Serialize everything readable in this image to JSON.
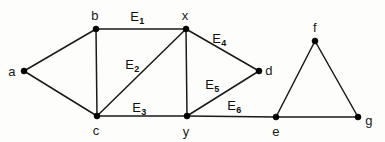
{
  "diagram": {
    "background_color": "#fdfdfb",
    "stroke_color": "#1a1a1a",
    "width": 385,
    "height": 142,
    "vertices": [
      {
        "id": "a",
        "label": "a",
        "x": 24,
        "y": 71,
        "label_x": 12,
        "label_y": 71
      },
      {
        "id": "b",
        "label": "b",
        "x": 96,
        "y": 29,
        "label_x": 95,
        "label_y": 15
      },
      {
        "id": "c",
        "label": "c",
        "x": 97,
        "y": 116,
        "label_x": 96,
        "label_y": 130
      },
      {
        "id": "x",
        "label": "x",
        "x": 186,
        "y": 29,
        "label_x": 185,
        "label_y": 15
      },
      {
        "id": "y",
        "label": "y",
        "x": 187,
        "y": 116,
        "label_x": 186,
        "label_y": 131
      },
      {
        "id": "d",
        "label": "d",
        "x": 259,
        "y": 71,
        "label_x": 269,
        "label_y": 70
      },
      {
        "id": "e",
        "label": "e",
        "x": 276,
        "y": 117,
        "label_x": 276,
        "label_y": 131
      },
      {
        "id": "f",
        "label": "f",
        "x": 315,
        "y": 41,
        "label_x": 315,
        "label_y": 27
      },
      {
        "id": "g",
        "label": "g",
        "x": 358,
        "y": 117,
        "label_x": 369,
        "label_y": 120
      }
    ],
    "edges": [
      {
        "id": "ab",
        "from": "a",
        "to": "b",
        "label": "",
        "subscript": ""
      },
      {
        "id": "ac",
        "from": "a",
        "to": "c",
        "label": "",
        "subscript": ""
      },
      {
        "id": "bc",
        "from": "b",
        "to": "c",
        "label": "",
        "subscript": ""
      },
      {
        "id": "bx",
        "from": "b",
        "to": "x",
        "label": "E",
        "subscript": "1",
        "label_x": 137,
        "label_y": 16
      },
      {
        "id": "cx",
        "from": "c",
        "to": "x",
        "label": "E",
        "subscript": "2",
        "label_x": 132,
        "label_y": 64
      },
      {
        "id": "cy",
        "from": "c",
        "to": "y",
        "label": "E",
        "subscript": "3",
        "label_x": 139,
        "label_y": 107
      },
      {
        "id": "xd",
        "from": "x",
        "to": "d",
        "label": "E",
        "subscript": "4",
        "label_x": 219,
        "label_y": 38
      },
      {
        "id": "xy",
        "from": "x",
        "to": "y",
        "label": "",
        "subscript": ""
      },
      {
        "id": "yd",
        "from": "y",
        "to": "d",
        "label": "E",
        "subscript": "5",
        "label_x": 212,
        "label_y": 84
      },
      {
        "id": "ye",
        "from": "y",
        "to": "e",
        "label": "E",
        "subscript": "6",
        "label_x": 234,
        "label_y": 105
      },
      {
        "id": "ef",
        "from": "e",
        "to": "f",
        "label": "",
        "subscript": ""
      },
      {
        "id": "eg",
        "from": "e",
        "to": "g",
        "label": "",
        "subscript": ""
      },
      {
        "id": "fg",
        "from": "f",
        "to": "g",
        "label": "",
        "subscript": ""
      }
    ],
    "edge_labels": [
      {
        "id": "E1",
        "base": "E",
        "sub": "1",
        "x": 137,
        "y": 16
      },
      {
        "id": "E2",
        "base": "E",
        "sub": "2",
        "x": 132,
        "y": 64
      },
      {
        "id": "E3",
        "base": "E",
        "sub": "3",
        "x": 139,
        "y": 107
      },
      {
        "id": "E4",
        "base": "E",
        "sub": "4",
        "x": 219,
        "y": 38
      },
      {
        "id": "E5",
        "base": "E",
        "sub": "5",
        "x": 212,
        "y": 84
      },
      {
        "id": "E6",
        "base": "E",
        "sub": "6",
        "x": 234,
        "y": 105
      }
    ]
  }
}
